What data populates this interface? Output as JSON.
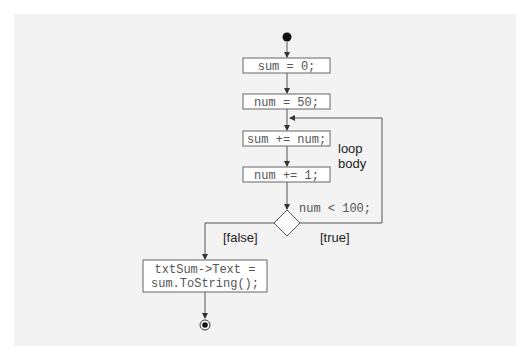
{
  "diagram": {
    "type": "UML activity diagram",
    "nodes": {
      "init": "sum = 0;",
      "start_num": "num = 50;",
      "add": "sum += num;",
      "incr": "num += 1;",
      "condition": "num < 100;",
      "output_line1": "txtSum->Text =",
      "output_line2": "sum.ToString();"
    },
    "labels": {
      "loop_body_line1": "loop",
      "loop_body_line2": "body",
      "false_guard": "[false]",
      "true_guard": "[true]"
    },
    "colors": {
      "line": "#555555",
      "box_fill": "#ffffff",
      "background": "#f3f3f3"
    }
  }
}
